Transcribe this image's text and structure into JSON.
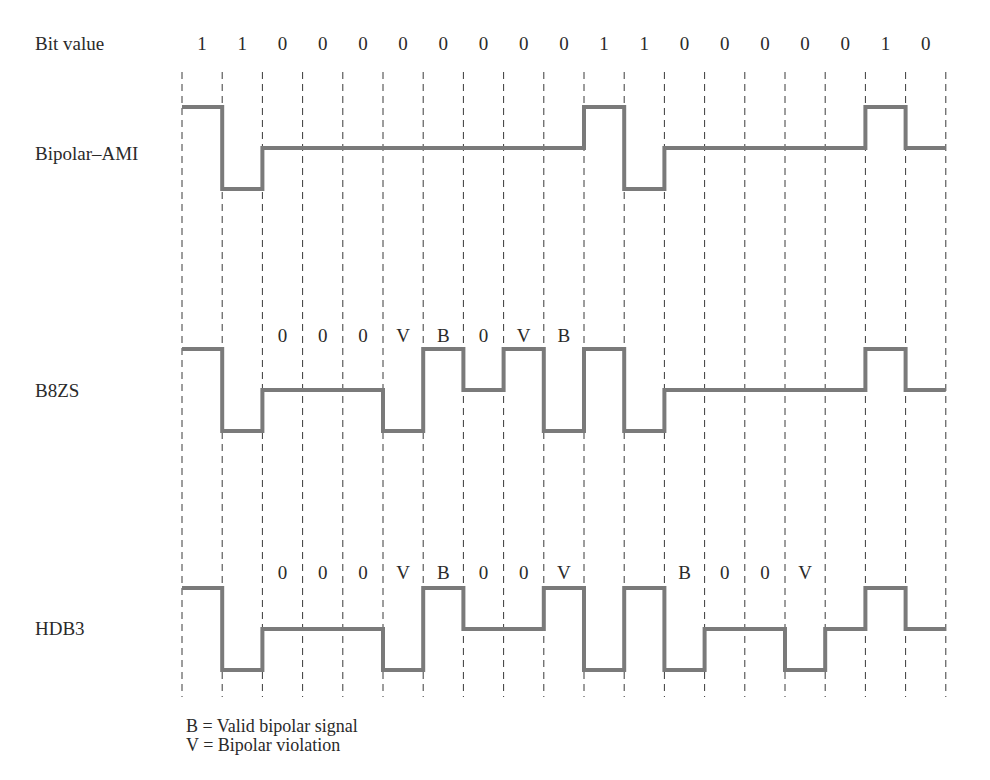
{
  "header": {
    "bit_value_label": "Bit value"
  },
  "bits": [
    "1",
    "1",
    "0",
    "0",
    "0",
    "0",
    "0",
    "0",
    "0",
    "0",
    "1",
    "1",
    "0",
    "0",
    "0",
    "0",
    "0",
    "1",
    "0"
  ],
  "signals": [
    {
      "name": "Bipolar–AMI",
      "levels": [
        1,
        -1,
        0,
        0,
        0,
        0,
        0,
        0,
        0,
        0,
        1,
        -1,
        0,
        0,
        0,
        0,
        0,
        1,
        0
      ],
      "annotations": []
    },
    {
      "name": "B8ZS",
      "levels": [
        1,
        -1,
        0,
        0,
        0,
        -1,
        1,
        0,
        1,
        -1,
        1,
        -1,
        0,
        0,
        0,
        0,
        0,
        1,
        0
      ],
      "annotations": [
        "",
        "",
        "0",
        "0",
        "0",
        "V",
        "B",
        "0",
        "V",
        "B",
        "",
        "",
        "",
        "",
        "",
        "",
        "",
        "",
        ""
      ]
    },
    {
      "name": "HDB3",
      "levels": [
        1,
        -1,
        0,
        0,
        0,
        -1,
        1,
        0,
        0,
        1,
        -1,
        1,
        -1,
        0,
        0,
        -1,
        0,
        1,
        0
      ],
      "annotations": [
        "",
        "",
        "0",
        "0",
        "0",
        "V",
        "B",
        "0",
        "0",
        "V",
        "",
        "",
        "B",
        "0",
        "0",
        "V",
        "",
        "",
        ""
      ]
    }
  ],
  "legend": {
    "b_line": "B = Valid bipolar signal",
    "v_line": "V = Bipolar violation"
  },
  "colors": {
    "signal": "#7a7a7a",
    "grid": "#3a3a3a",
    "text": "#2a2a2a"
  }
}
